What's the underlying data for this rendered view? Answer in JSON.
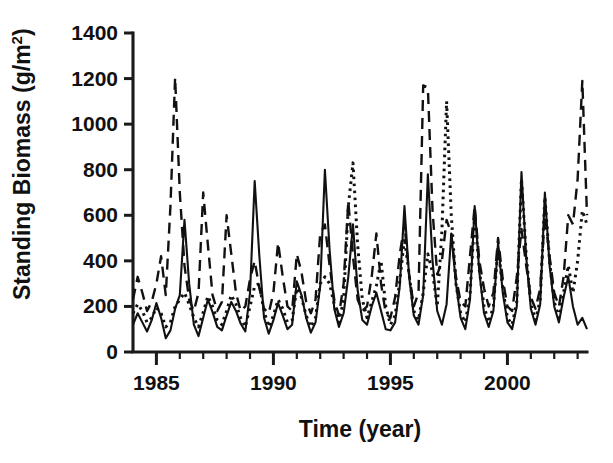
{
  "chart_data": {
    "type": "line",
    "title": "",
    "xlabel": "Time (year)",
    "ylabel": "Standing Biomass (g/m2)",
    "ylabel_display": "Standing Biomass (g/m",
    "ylabel_superscript": "2",
    "ylabel_tail": ")",
    "grid": false,
    "legend": "none",
    "xlim": [
      1984.0,
      2003.4
    ],
    "ylim": [
      0,
      1400
    ],
    "xticks_major": [
      1985,
      1990,
      1995,
      2000
    ],
    "xtick_labels": [
      "1985",
      "1990",
      "1995",
      "2000"
    ],
    "xticks_minor": [
      1986,
      1987,
      1988,
      1989,
      1991,
      1992,
      1993,
      1994,
      1996,
      1997,
      1998,
      1999,
      2001,
      2002,
      2003
    ],
    "yticks": [
      0,
      200,
      400,
      600,
      800,
      1000,
      1200,
      1400
    ],
    "ytick_labels": [
      "0",
      "200",
      "400",
      "600",
      "800",
      "1000",
      "1200",
      "1400"
    ],
    "series": [
      {
        "name": "site-1-solid",
        "style": "solid",
        "dash": "none",
        "color": "#111111",
        "width": 2.1,
        "x": [
          1984.0,
          1984.2,
          1984.4,
          1984.6,
          1984.8,
          1985.0,
          1985.2,
          1985.4,
          1985.6,
          1985.8,
          1986.0,
          1986.2,
          1986.4,
          1986.6,
          1986.8,
          1987.0,
          1987.2,
          1987.4,
          1987.6,
          1987.8,
          1988.0,
          1988.2,
          1988.4,
          1988.6,
          1988.8,
          1989.0,
          1989.2,
          1989.4,
          1989.6,
          1989.8,
          1990.0,
          1990.2,
          1990.4,
          1990.6,
          1990.8,
          1991.0,
          1991.2,
          1991.4,
          1991.6,
          1991.8,
          1992.0,
          1992.2,
          1992.4,
          1992.6,
          1992.8,
          1993.0,
          1993.2,
          1993.4,
          1993.6,
          1993.8,
          1994.0,
          1994.2,
          1994.4,
          1994.6,
          1994.8,
          1995.0,
          1995.2,
          1995.4,
          1995.6,
          1995.8,
          1996.0,
          1996.2,
          1996.4,
          1996.6,
          1996.8,
          1997.0,
          1997.2,
          1997.4,
          1997.6,
          1997.8,
          1998.0,
          1998.2,
          1998.4,
          1998.6,
          1998.8,
          1999.0,
          1999.2,
          1999.4,
          1999.6,
          1999.8,
          2000.0,
          2000.2,
          2000.4,
          2000.6,
          2000.8,
          2001.0,
          2001.2,
          2001.4,
          2001.6,
          2001.8,
          2002.0,
          2002.2,
          2002.4,
          2002.6,
          2002.8,
          2003.0,
          2003.2,
          2003.4
        ],
        "y": [
          120,
          170,
          130,
          90,
          140,
          215,
          150,
          60,
          95,
          190,
          250,
          580,
          300,
          120,
          70,
          150,
          230,
          175,
          110,
          95,
          160,
          220,
          180,
          125,
          90,
          260,
          750,
          420,
          150,
          80,
          140,
          215,
          160,
          100,
          120,
          310,
          250,
          150,
          85,
          130,
          290,
          800,
          450,
          190,
          110,
          170,
          330,
          560,
          270,
          140,
          120,
          200,
          260,
          180,
          100,
          95,
          130,
          290,
          640,
          330,
          160,
          120,
          250,
          780,
          400,
          180,
          120,
          210,
          520,
          300,
          150,
          100,
          230,
          640,
          350,
          170,
          110,
          180,
          480,
          260,
          130,
          100,
          200,
          790,
          420,
          190,
          120,
          210,
          700,
          380,
          200,
          130,
          240,
          330,
          200,
          120,
          150,
          100
        ]
      },
      {
        "name": "site-2-dashed",
        "style": "dashed",
        "dash": "11,7",
        "color": "#111111",
        "width": 2.4,
        "x": [
          1984.0,
          1984.2,
          1984.4,
          1984.6,
          1984.8,
          1985.0,
          1985.2,
          1985.4,
          1985.6,
          1985.8,
          1986.0,
          1986.2,
          1986.4,
          1986.6,
          1986.8,
          1987.0,
          1987.2,
          1987.4,
          1987.6,
          1987.8,
          1988.0,
          1988.2,
          1988.4,
          1988.6,
          1988.8,
          1989.0,
          1989.2,
          1989.4,
          1989.6,
          1989.8,
          1990.0,
          1990.2,
          1990.4,
          1990.6,
          1990.8,
          1991.0,
          1991.2,
          1991.4,
          1991.6,
          1991.8,
          1992.0,
          1992.2,
          1992.4,
          1992.6,
          1992.8,
          1993.0,
          1993.2,
          1993.4,
          1993.6,
          1993.8,
          1994.0,
          1994.2,
          1994.4,
          1994.6,
          1994.8,
          1995.0,
          1995.2,
          1995.4,
          1995.6,
          1995.8,
          1996.0,
          1996.2,
          1996.4,
          1996.6,
          1996.8,
          1997.0,
          1997.2,
          1997.4,
          1997.6,
          1997.8,
          1998.0,
          1998.2,
          1998.4,
          1998.6,
          1998.8,
          1999.0,
          1999.2,
          1999.4,
          1999.6,
          1999.8,
          2000.0,
          2000.2,
          2000.4,
          2000.6,
          2000.8,
          2001.0,
          2001.2,
          2001.4,
          2001.6,
          2001.8,
          2002.0,
          2002.2,
          2002.4,
          2002.6,
          2002.8,
          2003.0,
          2003.2,
          2003.4
        ],
        "y": [
          230,
          330,
          260,
          180,
          220,
          300,
          420,
          250,
          640,
          1205,
          700,
          380,
          230,
          180,
          260,
          700,
          470,
          250,
          180,
          220,
          600,
          430,
          260,
          180,
          200,
          320,
          400,
          280,
          190,
          170,
          260,
          480,
          330,
          200,
          180,
          430,
          350,
          220,
          170,
          230,
          520,
          560,
          380,
          230,
          160,
          300,
          660,
          420,
          230,
          180,
          200,
          330,
          520,
          300,
          170,
          150,
          240,
          430,
          560,
          340,
          200,
          260,
          1170,
          1160,
          620,
          340,
          400,
          580,
          520,
          330,
          220,
          200,
          420,
          640,
          400,
          280,
          200,
          260,
          500,
          320,
          200,
          180,
          330,
          540,
          380,
          240,
          190,
          280,
          600,
          420,
          260,
          200,
          330,
          600,
          560,
          760,
          1190,
          600
        ]
      },
      {
        "name": "site-3-dotted",
        "style": "dotted",
        "dash": "2.6,4.4",
        "color": "#111111",
        "width": 3.0,
        "x": [
          1984.0,
          1984.2,
          1984.4,
          1984.6,
          1984.8,
          1985.0,
          1985.2,
          1985.4,
          1985.6,
          1985.8,
          1986.0,
          1986.2,
          1986.4,
          1986.6,
          1986.8,
          1987.0,
          1987.2,
          1987.4,
          1987.6,
          1987.8,
          1988.0,
          1988.2,
          1988.4,
          1988.6,
          1988.8,
          1989.0,
          1989.2,
          1989.4,
          1989.6,
          1989.8,
          1990.0,
          1990.2,
          1990.4,
          1990.6,
          1990.8,
          1991.0,
          1991.2,
          1991.4,
          1991.6,
          1991.8,
          1992.0,
          1992.2,
          1992.4,
          1992.6,
          1992.8,
          1993.0,
          1993.2,
          1993.4,
          1993.6,
          1993.8,
          1994.0,
          1994.2,
          1994.4,
          1994.6,
          1994.8,
          1995.0,
          1995.2,
          1995.4,
          1995.6,
          1995.8,
          1996.0,
          1996.2,
          1996.4,
          1996.6,
          1996.8,
          1997.0,
          1997.2,
          1997.4,
          1997.6,
          1997.8,
          1998.0,
          1998.2,
          1998.4,
          1998.6,
          1998.8,
          1999.0,
          1999.2,
          1999.4,
          1999.6,
          1999.8,
          2000.0,
          2000.2,
          2000.4,
          2000.6,
          2000.8,
          2001.0,
          2001.2,
          2001.4,
          2001.6,
          2001.8,
          2002.0,
          2002.2,
          2002.4,
          2002.6,
          2002.8,
          2003.0,
          2003.2,
          2003.4
        ],
        "y": [
          170,
          210,
          180,
          130,
          150,
          195,
          170,
          110,
          130,
          200,
          230,
          260,
          210,
          150,
          110,
          175,
          245,
          200,
          140,
          120,
          180,
          250,
          210,
          150,
          110,
          200,
          290,
          300,
          180,
          110,
          160,
          230,
          190,
          130,
          140,
          280,
          240,
          160,
          110,
          150,
          300,
          330,
          300,
          210,
          130,
          230,
          640,
          830,
          470,
          230,
          150,
          220,
          290,
          400,
          200,
          120,
          160,
          310,
          500,
          340,
          180,
          140,
          260,
          430,
          350,
          200,
          530,
          1100,
          600,
          300,
          170,
          130,
          250,
          600,
          360,
          200,
          130,
          200,
          460,
          280,
          150,
          120,
          220,
          760,
          430,
          210,
          140,
          230,
          680,
          400,
          220,
          150,
          260,
          380,
          260,
          400,
          620,
          560
        ]
      }
    ]
  },
  "axes_geometry": {
    "plot_left": 133,
    "plot_right": 587,
    "plot_top": 33,
    "plot_bottom": 352
  }
}
